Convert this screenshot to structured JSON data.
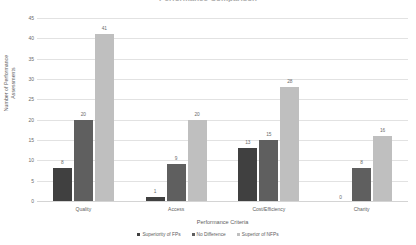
{
  "chart_data": {
    "type": "bar",
    "title": "Performance Comparison",
    "xlabel": "Performance Criteria",
    "ylabel_line1": "Number of Performance",
    "ylabel_line2": "Assessments",
    "categories": [
      "Quality",
      "Access",
      "Cost/Efficiency",
      "Charity"
    ],
    "series": [
      {
        "name": "Superiority of FPs",
        "color": "#404040",
        "values": [
          8,
          1,
          13,
          0
        ]
      },
      {
        "name": "No Difference",
        "color": "#5f5f5f",
        "values": [
          20,
          9,
          15,
          8
        ]
      },
      {
        "name": "Superior of NFPs",
        "color": "#bfbfbf",
        "values": [
          41,
          20,
          28,
          16
        ]
      }
    ],
    "ylim": [
      0,
      45
    ],
    "yticks": [
      "0",
      "5",
      "10",
      "15",
      "20",
      "25",
      "30",
      "35",
      "40",
      "45"
    ],
    "grid": true,
    "legend_position": "bottom",
    "data_labels": true
  }
}
